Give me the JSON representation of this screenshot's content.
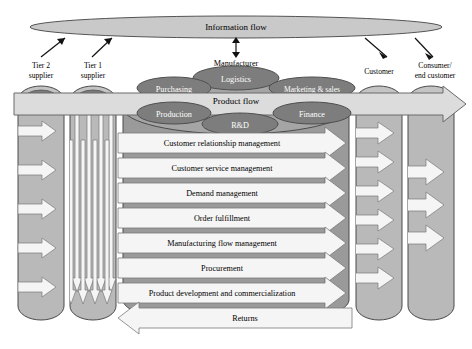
{
  "diagram": {
    "information_flow": {
      "label": "Information flow"
    },
    "product_flow": {
      "label": "Product flow"
    },
    "entities": [
      {
        "id": "tier2",
        "label_line1": "Tier 2",
        "label_line2": "supplier"
      },
      {
        "id": "tier1",
        "label_line1": "Tier 1",
        "label_line2": "supplier"
      },
      {
        "id": "manufacturer",
        "label_line1": "Manufacturer",
        "label_line2": ""
      },
      {
        "id": "customer",
        "label_line1": "Customer",
        "label_line2": ""
      },
      {
        "id": "consumer",
        "label_line1": "Consumer/",
        "label_line2": "end customer"
      }
    ],
    "functions": [
      {
        "id": "purchasing",
        "label": "Purchasing"
      },
      {
        "id": "logistics",
        "label": "Logistics"
      },
      {
        "id": "marketing-sales",
        "label": "Marketing & sales"
      },
      {
        "id": "production",
        "label": "Production"
      },
      {
        "id": "rd",
        "label": "R&D"
      },
      {
        "id": "finance",
        "label": "Finance"
      }
    ],
    "processes": [
      {
        "id": "crm",
        "label": "Customer relationship management",
        "direction": "right"
      },
      {
        "id": "csm",
        "label": "Customer service management",
        "direction": "right"
      },
      {
        "id": "demand",
        "label": "Demand management",
        "direction": "right"
      },
      {
        "id": "order",
        "label": "Order fulfillment",
        "direction": "right"
      },
      {
        "id": "mfg-flow",
        "label": "Manufacturing flow management",
        "direction": "right"
      },
      {
        "id": "procurement",
        "label": "Procurement",
        "direction": "right"
      },
      {
        "id": "pdc",
        "label": "Product development and commercialization",
        "direction": "right"
      },
      {
        "id": "returns",
        "label": "Returns",
        "direction": "left"
      }
    ],
    "colors": {
      "info_ellipse_fill": "#c9c9c9",
      "cylinder_fill": "#b9b9b9",
      "manufacturer_fill": "#9a9a9a",
      "function_ellipse_fill": "#8a8a8a",
      "process_arrow_fill": "#f2f2f2",
      "product_flow_fill": "#dcdcdc",
      "outline": "#4a4a4a",
      "text": "#111111"
    }
  }
}
